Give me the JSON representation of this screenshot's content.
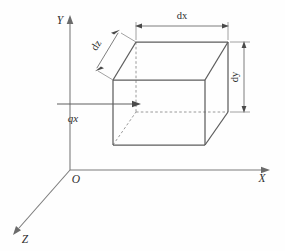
{
  "figure": {
    "background_color": "#fefefe",
    "line_color": "#5d5d5d",
    "hidden_line_color": "#8e8e8e",
    "label_color": "#2e2e2e"
  },
  "axes": {
    "origin_label": "O",
    "x_label": "X",
    "y_label": "Y",
    "z_label": "Z"
  },
  "dimensions": {
    "width_label": "dx",
    "height_label": "dy",
    "depth_label": "dz"
  },
  "flux": {
    "label": "qx"
  }
}
